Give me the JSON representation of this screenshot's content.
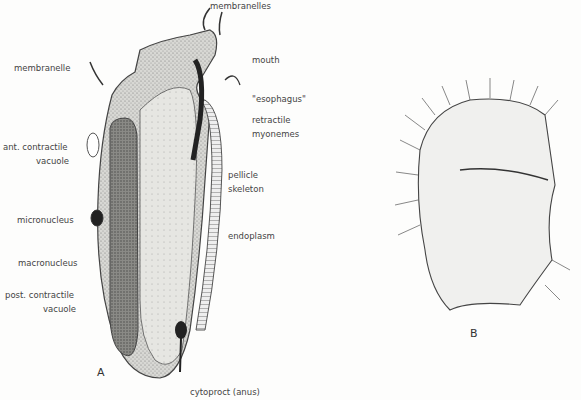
{
  "figure": {
    "panels": [
      {
        "id": "A",
        "label": "A"
      },
      {
        "id": "B",
        "label": "B"
      }
    ],
    "labels": {
      "membranelles": "membranelles",
      "membranelle": "membranelle",
      "mouth": "mouth",
      "esophagus": "\"esophagus\"",
      "retractile_1": "retractile",
      "retractile_2": "myonemes",
      "ant_cv_1": "ant. contractile",
      "ant_cv_2": "vacuole",
      "pellicle_1": "pellicle",
      "pellicle_2": "skeleton",
      "micronucleus": "micronucleus",
      "endoplasm": "endoplasm",
      "macronucleus": "macronucleus",
      "post_cv_1": "post. contractile",
      "post_cv_2": "vacuole",
      "cytoproct": "cytoproct (anus)"
    }
  }
}
